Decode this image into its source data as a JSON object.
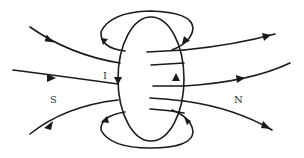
{
  "diagram": {
    "labels": {
      "current": "I",
      "south_pole": "S",
      "north_pole": "N"
    },
    "colors": {
      "stroke": "#1a1a1a",
      "label": "#333333",
      "background": "#ffffff"
    },
    "elements": [
      {
        "name": "coil-loop",
        "shape": "ellipse",
        "center": [
          151,
          79
        ],
        "rx": 33,
        "ry": 62
      },
      {
        "name": "field-line-left-top",
        "direction": "into-coil"
      },
      {
        "name": "field-line-left-middle",
        "direction": "into-coil"
      },
      {
        "name": "field-line-left-bottom",
        "direction": "into-coil"
      },
      {
        "name": "field-line-right-top",
        "direction": "out-of-coil"
      },
      {
        "name": "field-line-right-middle",
        "direction": "out-of-coil"
      },
      {
        "name": "field-line-right-bottom",
        "direction": "out-of-coil"
      },
      {
        "name": "field-loop-top",
        "direction": "around-wire"
      },
      {
        "name": "field-loop-bottom",
        "direction": "around-wire"
      },
      {
        "name": "current-arrow-left",
        "direction": "down"
      },
      {
        "name": "current-arrow-right",
        "direction": "up"
      }
    ]
  }
}
